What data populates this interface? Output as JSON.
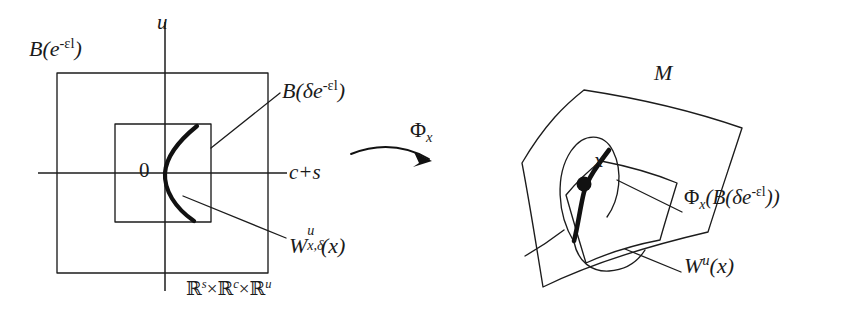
{
  "figure": {
    "domain": "mathematical-diagram",
    "background_color": "#ffffff",
    "ink_color": "#1a1a1a",
    "bold_curve_color": "#111111"
  },
  "left_panel": {
    "axis_vertical_label": "u",
    "axis_horizontal_label": "c+s",
    "origin_label": "0",
    "outer_box_label": {
      "base": "B(e",
      "exponent": "-εl",
      "close": ")"
    },
    "inner_box_label": {
      "base": "B(δe",
      "exponent": "-εl",
      "close": ")"
    },
    "local_manifold_label": {
      "base": "W",
      "sup": "u",
      "sub": "x,δ",
      "arg": "(x)"
    },
    "ambient_space_label": {
      "r1": "ℝ",
      "s1": "s",
      "times1": "×",
      "r2": "ℝ",
      "s2": "c",
      "times2": "×",
      "r3": "ℝ",
      "s3": "u"
    }
  },
  "map_arrow": {
    "label_base": "Φ",
    "label_sub": "x"
  },
  "right_panel": {
    "manifold_label": "M",
    "point_label": "x",
    "image_box_label": {
      "phi": "Φ",
      "phi_sub": "x",
      "open": "(B(δe",
      "exponent": "-εl",
      "close": "))"
    },
    "unstable_manifold_label": {
      "base": "W",
      "sup": "u",
      "arg": "(x)"
    }
  }
}
